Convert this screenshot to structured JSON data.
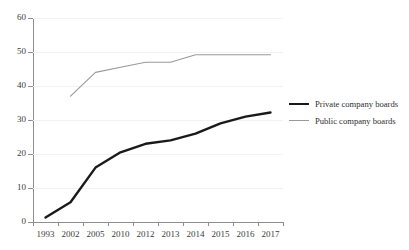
{
  "chart_data": {
    "type": "line",
    "title": "",
    "subtitle": "",
    "xlabel": "",
    "ylabel": "",
    "categories": [
      "1993",
      "2002",
      "2005",
      "2010",
      "2012",
      "2013",
      "2014",
      "2015",
      "2016",
      "2017"
    ],
    "ylim": [
      0,
      60
    ],
    "ytick_labels": [
      "0",
      "10",
      "20",
      "30",
      "40",
      "50",
      "60"
    ],
    "ytick_values": [
      0,
      10,
      20,
      30,
      40,
      50,
      60
    ],
    "grid": true,
    "grid_axis": "y",
    "legend_position": "right",
    "series": [
      {
        "name": "Private company boards",
        "color": "#1a1a1a",
        "line_width": 2.4,
        "values": [
          1.3,
          5.8,
          16.0,
          20.5,
          23.0,
          24.0,
          26.0,
          29.0,
          31.0,
          32.2
        ]
      },
      {
        "name": "Public company boards",
        "color": "#999999",
        "line_width": 1.1,
        "values": [
          null,
          37.0,
          44.0,
          45.5,
          47.0,
          47.0,
          49.2,
          49.2,
          49.2,
          49.2
        ]
      }
    ]
  },
  "legend": {
    "items": [
      {
        "label": "Private company boards",
        "swatch": "line-swatch-black"
      },
      {
        "label": "Public company boards",
        "swatch": "line-swatch-gray"
      }
    ]
  },
  "colors": {
    "private_series": "#1a1a1a",
    "public_series": "#999999",
    "axis": "#8e8e8e",
    "gridline": "#f2f2f2",
    "text": "#3b3b3b",
    "background": "#ffffff"
  }
}
